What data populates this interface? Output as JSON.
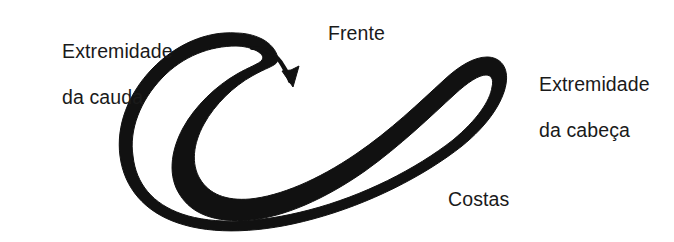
{
  "figure": {
    "background_color": "#ffffff",
    "ink_color": "#111111",
    "width": 674,
    "height": 242,
    "labels": {
      "tail_extremity": "Extremidade\nda cauda",
      "tail_extremity_line1": "Extremidade",
      "tail_extremity_line2": "da cauda",
      "front": "Frente",
      "head_extremity": "Extremidade\nda cabeça",
      "head_extremity_line1": "Extremidade",
      "head_extremity_line2": "da cabeça",
      "back": "Costas"
    },
    "annotations": {
      "arrow_direction": "curved-arrow-pointing-down-right",
      "arrow_meaning": "Frente"
    },
    "body_shape": {
      "type": "thick-curved-band",
      "description": "corpo alongado curvado em forma de gancho",
      "tail_end_position": "esquerda-superior",
      "head_end_position": "direita"
    }
  }
}
